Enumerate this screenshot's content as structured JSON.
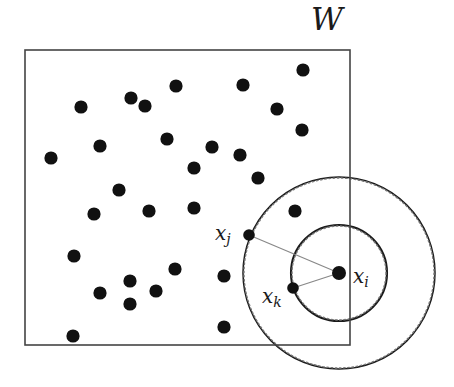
{
  "figure": {
    "type": "point-process-diagram",
    "background_color": "#ffffff",
    "ink_color": "#111111",
    "window": {
      "label": "W",
      "label_x": 327,
      "label_y": 30,
      "label_font_size": 31,
      "x": 25,
      "y": 50,
      "width": 325,
      "height": 295,
      "stroke": "#444444",
      "stroke_width": 1.6,
      "fill": "none"
    },
    "circles": [
      {
        "name": "inner-solid-circle",
        "cx": 339,
        "cy": 273,
        "r": 48,
        "stroke": "#1a1a1a",
        "stroke_width": 2.1,
        "dash": "none"
      },
      {
        "name": "inner-dotted-circle",
        "cx": 339,
        "cy": 273,
        "r": 47,
        "stroke": "#777777",
        "stroke_width": 1.4,
        "dash": "1.6 2.6"
      },
      {
        "name": "outer-solid-circle",
        "cx": 339,
        "cy": 273,
        "r": 96,
        "stroke": "#1a1a1a",
        "stroke_width": 1.5,
        "dash": "none"
      },
      {
        "name": "outer-dotted-circle",
        "cx": 339,
        "cy": 273,
        "r": 95,
        "stroke": "#777777",
        "stroke_width": 1.4,
        "dash": "1.6 2.6"
      }
    ],
    "connectors": [
      {
        "name": "xi-to-xj-segment",
        "x1": 339,
        "y1": 273,
        "x2": 249,
        "y2": 235,
        "stroke": "#888888",
        "stroke_width": 1.2
      },
      {
        "name": "xi-to-xk-segment",
        "x1": 339,
        "y1": 273,
        "x2": 293,
        "y2": 288,
        "stroke": "#888888",
        "stroke_width": 1.2
      }
    ],
    "labelled_points": [
      {
        "name": "point-xi",
        "label": "x",
        "sub": "i",
        "cx": 339,
        "cy": 273,
        "r": 7.0,
        "label_x": 353,
        "label_y": 283,
        "font_size": 20
      },
      {
        "name": "point-xj",
        "label": "x",
        "sub": "j",
        "cx": 249,
        "cy": 235,
        "r": 5.8,
        "label_x": 215,
        "label_y": 240,
        "font_size": 20
      },
      {
        "name": "point-xk",
        "label": "x",
        "sub": "k",
        "cx": 293,
        "cy": 288,
        "r": 5.8,
        "label_x": 262,
        "label_y": 303,
        "font_size": 20
      }
    ],
    "points": [
      {
        "cx": 303,
        "cy": 70,
        "r": 6.6
      },
      {
        "cx": 243,
        "cy": 85,
        "r": 6.6
      },
      {
        "cx": 176,
        "cy": 86,
        "r": 6.6
      },
      {
        "cx": 131,
        "cy": 98,
        "r": 6.6
      },
      {
        "cx": 145,
        "cy": 106,
        "r": 6.6
      },
      {
        "cx": 81,
        "cy": 107,
        "r": 6.6
      },
      {
        "cx": 277,
        "cy": 109,
        "r": 6.6
      },
      {
        "cx": 302,
        "cy": 130,
        "r": 6.6
      },
      {
        "cx": 167,
        "cy": 139,
        "r": 6.6
      },
      {
        "cx": 100,
        "cy": 146,
        "r": 6.6
      },
      {
        "cx": 212,
        "cy": 147,
        "r": 6.6
      },
      {
        "cx": 240,
        "cy": 155,
        "r": 6.6
      },
      {
        "cx": 51,
        "cy": 158,
        "r": 6.6
      },
      {
        "cx": 194,
        "cy": 168,
        "r": 6.6
      },
      {
        "cx": 258,
        "cy": 178,
        "r": 6.6
      },
      {
        "cx": 119,
        "cy": 190,
        "r": 6.6
      },
      {
        "cx": 149,
        "cy": 211,
        "r": 6.6
      },
      {
        "cx": 194,
        "cy": 208,
        "r": 6.6
      },
      {
        "cx": 295,
        "cy": 211,
        "r": 6.6
      },
      {
        "cx": 94,
        "cy": 214,
        "r": 6.6
      },
      {
        "cx": 74,
        "cy": 256,
        "r": 6.6
      },
      {
        "cx": 224,
        "cy": 276,
        "r": 6.6
      },
      {
        "cx": 175,
        "cy": 269,
        "r": 6.6
      },
      {
        "cx": 130,
        "cy": 281,
        "r": 6.6
      },
      {
        "cx": 156,
        "cy": 291,
        "r": 6.6
      },
      {
        "cx": 100,
        "cy": 293,
        "r": 6.6
      },
      {
        "cx": 130,
        "cy": 304,
        "r": 6.6
      },
      {
        "cx": 224,
        "cy": 327,
        "r": 6.6
      },
      {
        "cx": 73,
        "cy": 336,
        "r": 6.6
      }
    ]
  }
}
